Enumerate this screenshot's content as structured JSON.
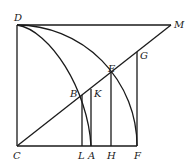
{
  "figure": {
    "points": {
      "D": "D",
      "M": "M",
      "G": "G",
      "E": "E",
      "B": "B",
      "K": "K",
      "C": "C",
      "L": "L",
      "A": "A",
      "H": "H",
      "F": "F"
    },
    "segments": [
      "DC",
      "CF",
      "DM",
      "CM",
      "BL",
      "KA",
      "EH",
      "GF"
    ],
    "curves": [
      "arc DF (center C)",
      "curve DA through B"
    ]
  }
}
